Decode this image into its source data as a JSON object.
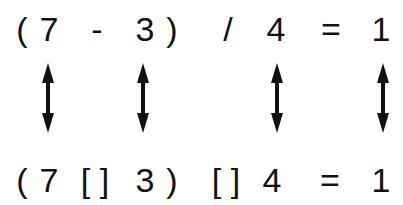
{
  "top_equation": {
    "tokens": [
      {
        "text": "(",
        "x": 22
      },
      {
        "text": "7",
        "x": 49
      },
      {
        "text": "-",
        "x": 97
      },
      {
        "text": "3",
        "x": 145
      },
      {
        "text": ")",
        "x": 172
      },
      {
        "text": "/",
        "x": 228
      },
      {
        "text": "4",
        "x": 276
      },
      {
        "text": "=",
        "x": 331
      },
      {
        "text": "1",
        "x": 381
      }
    ]
  },
  "bottom_equation": {
    "tokens": [
      {
        "text": "(",
        "x": 22
      },
      {
        "text": "7",
        "x": 49
      },
      {
        "text": "[ ]",
        "x": 95
      },
      {
        "text": "3",
        "x": 145
      },
      {
        "text": ")",
        "x": 172
      },
      {
        "text": "[ ]",
        "x": 226
      },
      {
        "text": "4",
        "x": 272
      },
      {
        "text": "=",
        "x": 330
      },
      {
        "text": "1",
        "x": 381
      }
    ]
  },
  "arrows": [
    {
      "icon": "double-arrow-vertical",
      "x": 48
    },
    {
      "icon": "double-arrow-vertical",
      "x": 143
    },
    {
      "icon": "double-arrow-vertical",
      "x": 277
    },
    {
      "icon": "double-arrow-vertical",
      "x": 383
    }
  ],
  "colors": {
    "ink": "#111111",
    "background": "#ffffff"
  }
}
